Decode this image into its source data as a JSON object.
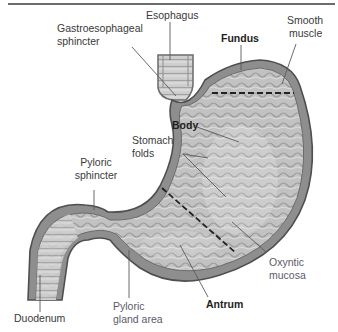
{
  "figure": {
    "labels": {
      "esophagus": "Esophagus",
      "gastroesophageal_sphincter": [
        "Gastroesophageal",
        "sphincter"
      ],
      "fundus": "Fundus",
      "smooth_muscle": [
        "Smooth",
        "muscle"
      ],
      "body": "Body",
      "stomach_folds": [
        "Stomach",
        "folds"
      ],
      "pyloric_sphincter": [
        "Pyloric",
        "sphincter"
      ],
      "oxyntic_mucosa": [
        "Oxyntic",
        "mucosa"
      ],
      "duodenum": "Duodenum",
      "pyloric_gland_area": [
        "Pyloric",
        "gland area"
      ],
      "antrum": "Antrum"
    },
    "bold_labels": [
      "Fundus",
      "Body",
      "Antrum"
    ],
    "region_dividers": [
      "fundus-body boundary",
      "body-antrum boundary"
    ],
    "colors": {
      "rule": "#6b6b6b",
      "wall": "#8a8a8a",
      "wall_dark": "#555555",
      "mucosa": "#bdbdbd",
      "mucosa_light": "#d6d6d6",
      "leader_line": "#5a5a5a",
      "divider": "#222222",
      "label_text": "#3a3a3a"
    }
  }
}
